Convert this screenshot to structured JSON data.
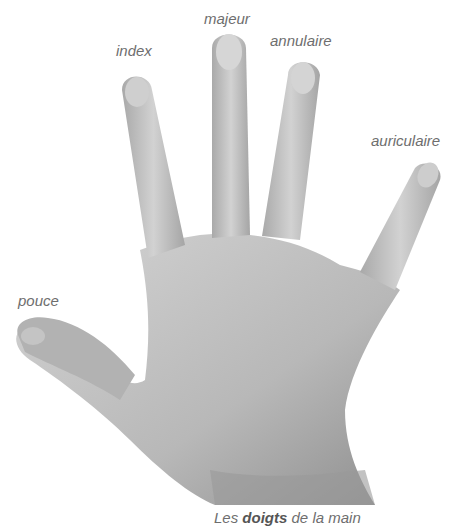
{
  "title": "Les doigts de la main",
  "caption": {
    "prefix": "Les ",
    "emphasis": "doigts",
    "suffix": " de la main"
  },
  "labels": {
    "thumb": "pouce",
    "index": "index",
    "middle": "majeur",
    "ring": "annulaire",
    "little": "auriculaire"
  },
  "colors": {
    "label": "#6e6e6e",
    "skin_light": "#d6d6d6",
    "skin_mid": "#b4b4b4",
    "skin_dark": "#8a8a8a",
    "background": "#ffffff"
  }
}
